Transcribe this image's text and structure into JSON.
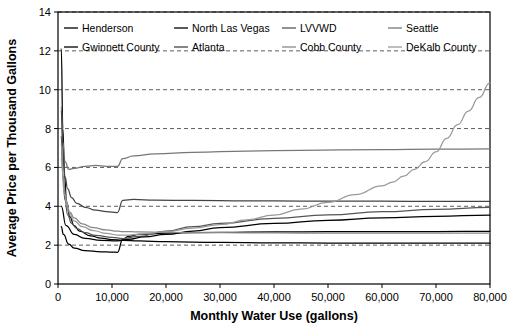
{
  "chart_data": {
    "type": "line",
    "title": "",
    "xlabel": "Monthly Water Use (gallons)",
    "ylabel": "Average Price per Thousand Gallons",
    "xlim": [
      0,
      80000
    ],
    "ylim": [
      0,
      14
    ],
    "xticks": [
      0,
      10000,
      20000,
      30000,
      40000,
      50000,
      60000,
      70000,
      80000
    ],
    "xtick_labels": [
      "0",
      "10,000",
      "20,000",
      "30,000",
      "40,000",
      "50,000",
      "60,000",
      "70,000",
      "80,000"
    ],
    "yticks": [
      0,
      2,
      4,
      6,
      8,
      10,
      12,
      14
    ],
    "ytick_labels": [
      "0",
      "2",
      "4",
      "6",
      "8",
      "10",
      "12",
      "14"
    ],
    "grid": "horizontal-dashed",
    "legend_position": "top-inside",
    "series": [
      {
        "name": "Henderson",
        "color": "#000000",
        "points": [
          [
            600,
            2.95
          ],
          [
            1000,
            2.55
          ],
          [
            2000,
            2.05
          ],
          [
            3000,
            1.85
          ],
          [
            5000,
            1.72
          ],
          [
            8000,
            1.66
          ],
          [
            10000,
            1.64
          ],
          [
            11000,
            1.63
          ],
          [
            12000,
            2.3
          ],
          [
            13000,
            2.45
          ],
          [
            15000,
            2.55
          ],
          [
            20000,
            2.62
          ],
          [
            30000,
            2.66
          ],
          [
            40000,
            2.68
          ],
          [
            50000,
            2.69
          ],
          [
            60000,
            2.7
          ],
          [
            70000,
            2.7
          ],
          [
            80000,
            2.71
          ]
        ]
      },
      {
        "name": "North Las Vegas",
        "color": "#000000",
        "points": [
          [
            600,
            12.1
          ],
          [
            900,
            8.0
          ],
          [
            1200,
            5.6
          ],
          [
            1600,
            4.2
          ],
          [
            2200,
            3.45
          ],
          [
            3000,
            3.0
          ],
          [
            4000,
            2.72
          ],
          [
            6000,
            2.48
          ],
          [
            8000,
            2.36
          ],
          [
            10000,
            2.28
          ],
          [
            12000,
            2.25
          ],
          [
            15000,
            2.22
          ],
          [
            20000,
            2.18
          ],
          [
            30000,
            2.14
          ],
          [
            40000,
            2.12
          ],
          [
            50000,
            2.11
          ],
          [
            60000,
            2.1
          ],
          [
            70000,
            2.1
          ],
          [
            80000,
            2.1
          ]
        ]
      },
      {
        "name": "LVVWD",
        "color": "#555555",
        "points": [
          [
            600,
            7.6
          ],
          [
            900,
            5.6
          ],
          [
            1300,
            4.3
          ],
          [
            1800,
            3.55
          ],
          [
            2500,
            3.12
          ],
          [
            3500,
            2.85
          ],
          [
            5000,
            2.64
          ],
          [
            7000,
            2.5
          ],
          [
            10000,
            2.4
          ],
          [
            12000,
            2.34
          ],
          [
            15000,
            2.45
          ],
          [
            20000,
            2.72
          ],
          [
            25000,
            2.95
          ],
          [
            30000,
            3.12
          ],
          [
            40000,
            3.38
          ],
          [
            50000,
            3.56
          ],
          [
            60000,
            3.72
          ],
          [
            70000,
            3.84
          ],
          [
            80000,
            3.95
          ]
        ]
      },
      {
        "name": "Seattle",
        "color": "#777777",
        "points": [
          [
            600,
            9.1
          ],
          [
            900,
            7.3
          ],
          [
            1300,
            6.3
          ],
          [
            2000,
            5.9
          ],
          [
            3000,
            5.95
          ],
          [
            5000,
            6.05
          ],
          [
            7000,
            6.1
          ],
          [
            9000,
            6.05
          ],
          [
            11000,
            6.05
          ],
          [
            12000,
            6.45
          ],
          [
            14000,
            6.6
          ],
          [
            18000,
            6.7
          ],
          [
            25000,
            6.78
          ],
          [
            35000,
            6.84
          ],
          [
            45000,
            6.88
          ],
          [
            60000,
            6.92
          ],
          [
            70000,
            6.94
          ],
          [
            80000,
            6.95
          ]
        ]
      },
      {
        "name": "Gwinnett County",
        "color": "#000000",
        "points": [
          [
            600,
            4.0
          ],
          [
            1500,
            3.0
          ],
          [
            3000,
            2.55
          ],
          [
            5000,
            2.35
          ],
          [
            8000,
            2.25
          ],
          [
            11000,
            2.22
          ],
          [
            13000,
            2.3
          ],
          [
            16000,
            2.42
          ],
          [
            20000,
            2.55
          ],
          [
            25000,
            2.72
          ],
          [
            30000,
            2.9
          ],
          [
            40000,
            3.12
          ],
          [
            50000,
            3.28
          ],
          [
            60000,
            3.4
          ],
          [
            70000,
            3.48
          ],
          [
            80000,
            3.55
          ]
        ]
      },
      {
        "name": "Atlanta",
        "color": "#444444",
        "points": [
          [
            600,
            8.9
          ],
          [
            900,
            7.0
          ],
          [
            1300,
            5.5
          ],
          [
            1800,
            4.9
          ],
          [
            2500,
            4.45
          ],
          [
            3500,
            4.15
          ],
          [
            5000,
            3.95
          ],
          [
            7000,
            3.8
          ],
          [
            9000,
            3.72
          ],
          [
            11000,
            3.68
          ],
          [
            12000,
            4.3
          ],
          [
            14000,
            4.35
          ],
          [
            18000,
            4.32
          ],
          [
            25000,
            4.3
          ],
          [
            35000,
            4.28
          ],
          [
            45000,
            4.27
          ],
          [
            60000,
            4.26
          ],
          [
            70000,
            4.25
          ],
          [
            80000,
            4.25
          ]
        ]
      },
      {
        "name": "Cobb County",
        "color": "#888888",
        "points": [
          [
            600,
            7.2
          ],
          [
            1000,
            5.3
          ],
          [
            1500,
            4.3
          ],
          [
            2200,
            3.7
          ],
          [
            3000,
            3.4
          ],
          [
            4500,
            3.1
          ],
          [
            6500,
            2.9
          ],
          [
            9000,
            2.78
          ],
          [
            11000,
            2.72
          ],
          [
            12000,
            2.7
          ],
          [
            15000,
            2.68
          ],
          [
            20000,
            2.66
          ],
          [
            30000,
            2.64
          ],
          [
            40000,
            2.63
          ],
          [
            50000,
            2.62
          ],
          [
            60000,
            2.62
          ],
          [
            70000,
            2.62
          ],
          [
            80000,
            2.62
          ]
        ]
      },
      {
        "name": "DeKalb County",
        "color": "#999999",
        "points": [
          [
            600,
            6.4
          ],
          [
            1200,
            4.6
          ],
          [
            2000,
            3.7
          ],
          [
            3000,
            3.25
          ],
          [
            4500,
            2.95
          ],
          [
            6500,
            2.75
          ],
          [
            9000,
            2.6
          ],
          [
            11000,
            2.52
          ],
          [
            13000,
            2.52
          ],
          [
            16000,
            2.58
          ],
          [
            20000,
            2.7
          ],
          [
            25000,
            2.88
          ],
          [
            30000,
            3.05
          ],
          [
            35000,
            3.3
          ],
          [
            40000,
            3.55
          ],
          [
            45000,
            3.85
          ],
          [
            50000,
            4.2
          ],
          [
            55000,
            4.6
          ],
          [
            60000,
            5.05
          ],
          [
            62000,
            5.25
          ],
          [
            64000,
            5.55
          ],
          [
            66000,
            5.9
          ],
          [
            68000,
            6.3
          ],
          [
            70000,
            6.8
          ],
          [
            72000,
            7.5
          ],
          [
            74000,
            8.2
          ],
          [
            76000,
            8.9
          ],
          [
            78000,
            9.6
          ],
          [
            80000,
            10.35
          ]
        ]
      }
    ],
    "legend": [
      {
        "label": "Henderson",
        "row": 0,
        "col": 0
      },
      {
        "label": "North Las Vegas",
        "row": 0,
        "col": 1
      },
      {
        "label": "LVVWD",
        "row": 0,
        "col": 2
      },
      {
        "label": "Seattle",
        "row": 0,
        "col": 3
      },
      {
        "label": "Gwinnett County",
        "row": 1,
        "col": 0
      },
      {
        "label": "Atlanta",
        "row": 1,
        "col": 1
      },
      {
        "label": "Cobb County",
        "row": 1,
        "col": 2
      },
      {
        "label": "DeKalb County",
        "row": 1,
        "col": 3
      }
    ]
  }
}
